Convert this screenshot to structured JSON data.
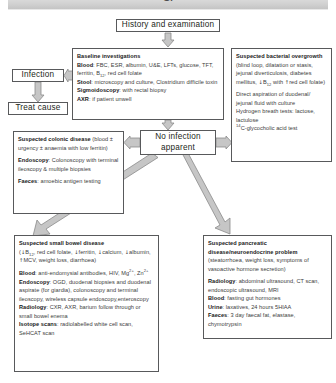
{
  "header": {
    "title": "GI",
    "bar_color": "#cfcfcf"
  },
  "diagram": {
    "type": "flowchart",
    "colors": {
      "box_border": "#58595b",
      "arrow_fill": "#c6c6c6",
      "arrow_stroke": "#8a8a8a",
      "text": "#3c3c3c",
      "heading_text": "#1a1a1a"
    },
    "nodes": {
      "history": {
        "label": "History and examination"
      },
      "baseline": {
        "heading": "Baseline investigations",
        "lines": [
          {
            "label": "Blood",
            "text": ": FBC, ESR, albumin, U&E, LFTs, glucose, TFT, ferritin, B12, red cell folate"
          },
          {
            "label": "Stool",
            "text": ": microscopy and culture, Clostridium difficile toxin"
          },
          {
            "label": "Sigmoidoscopy",
            "text": ": with rectal biopsy"
          },
          {
            "label": "AXR",
            "text": ": if patient unwell"
          }
        ]
      },
      "infection": {
        "label": "Infection"
      },
      "treat_cause": {
        "label": "Treat cause"
      },
      "no_infection": {
        "label": "No infection apparent"
      },
      "bacterial": {
        "heading": "Suspected bacterial overgrowth",
        "heading_tail": " (blind loop, dilatation or stasis, jejunal diverticulosis, diabetes mellitus, ↓B12 with ↑red cell folate)",
        "body": [
          "Direct aspiration of duodenal/ jejunal fluid with culture",
          "Hydrogen breath tests: lactose, lactulose",
          "14C-glycocholic acid test"
        ]
      },
      "colonic": {
        "heading": "Suspected colonic disease",
        "heading_tail": " (blood ± urgency ± anaemia with low ferritin)",
        "lines": [
          {
            "label": "Endoscopy",
            "text": ": Colonoscopy with terminal ileoscopy & multiple biopsies"
          },
          {
            "label": "Faeces",
            "text": ": amoebic antigen testing"
          }
        ]
      },
      "small_bowel": {
        "heading": "Suspected small bowel disease",
        "heading_tail": " (↓B12, red cell folate, ↓ferritin, ↓calcium, ↓albumin, ↑MCV, weight loss, diarrhoea)",
        "lines": [
          {
            "label": "Blood",
            "text": ": anti-endomysial antibodies, HIV, Mg2+, Zn2+"
          },
          {
            "label": "Endoscopy",
            "text": ": OGD, duodenal biopsies and duodenal aspirate (for giardia), colonoscopy and terminal ileoscopy, wireless capsule endoscopy,enteroscopy"
          },
          {
            "label": "Radiology",
            "text": ": CXR, AXR, barium follow through or small bowel enema"
          },
          {
            "label": "Isotope scans",
            "text": ": radiolabelled white cell scan, SeHCAT scan"
          }
        ]
      },
      "pancreas": {
        "heading": "Suspected pancreatic disease/neuroendocrine problem",
        "heading_tail": " (steatorrhoea, weight loss, symptoms of vasoactive hormone secretion)",
        "lines": [
          {
            "label": "Radiology",
            "text": ": abdominal ultrasound, CT scan, endoscopic ultrasound, MRI"
          },
          {
            "label": "Blood",
            "text": ": fasting gut hormones"
          },
          {
            "label": "Urine",
            "text": ": laxatives, 24 hours 5HIAA"
          },
          {
            "label": "Faeces",
            "text": ": 3 day faecal fat, elastase, chymotrypsin"
          }
        ]
      }
    },
    "edges": [
      {
        "from": "history",
        "to": "baseline",
        "direction": "down"
      },
      {
        "from": "baseline",
        "to": "infection",
        "direction": "left"
      },
      {
        "from": "infection",
        "to": "treat_cause",
        "direction": "down"
      },
      {
        "from": "baseline",
        "to": "no_infection",
        "direction": "down"
      },
      {
        "from": "no_infection",
        "to": "colonic",
        "direction": "left"
      },
      {
        "from": "no_infection",
        "to": "bacterial",
        "direction": "right"
      },
      {
        "from": "no_infection",
        "to": "small_bowel",
        "direction": "down-left"
      },
      {
        "from": "no_infection",
        "to": "pancreas",
        "direction": "down-right"
      }
    ]
  }
}
